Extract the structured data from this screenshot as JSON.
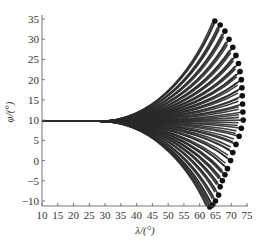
{
  "chart_data": {
    "type": "line",
    "title": "",
    "xlabel": "λ/(°)",
    "ylabel": "φ/(°)",
    "xlim": [
      10,
      75
    ],
    "ylim": [
      -11,
      35
    ],
    "xticks": [
      10,
      15,
      20,
      25,
      30,
      35,
      40,
      45,
      50,
      55,
      60,
      65,
      70,
      75
    ],
    "yticks": [
      -10,
      -5,
      0,
      5,
      10,
      15,
      20,
      25,
      30,
      35
    ],
    "grid": false,
    "legend": null,
    "start_point": {
      "lambda": 10,
      "phi": 9.7
    },
    "fan_start_lambda": 28,
    "endpoints": [
      {
        "lambda": 64.8,
        "phi": 34.5
      },
      {
        "lambda": 66.5,
        "phi": 33.5
      },
      {
        "lambda": 68.0,
        "phi": 32.0
      },
      {
        "lambda": 69.3,
        "phi": 30.0
      },
      {
        "lambda": 70.5,
        "phi": 28.0
      },
      {
        "lambda": 71.5,
        "phi": 26.0
      },
      {
        "lambda": 72.3,
        "phi": 24.0
      },
      {
        "lambda": 72.8,
        "phi": 22.0
      },
      {
        "lambda": 73.2,
        "phi": 20.0
      },
      {
        "lambda": 73.4,
        "phi": 18.0
      },
      {
        "lambda": 73.5,
        "phi": 16.0
      },
      {
        "lambda": 73.6,
        "phi": 14.0
      },
      {
        "lambda": 73.7,
        "phi": 12.0
      },
      {
        "lambda": 73.8,
        "phi": 10.0
      },
      {
        "lambda": 73.2,
        "phi": 8.0
      },
      {
        "lambda": 72.5,
        "phi": 6.0
      },
      {
        "lambda": 71.5,
        "phi": 4.0
      },
      {
        "lambda": 70.5,
        "phi": 2.0
      },
      {
        "lambda": 69.8,
        "phi": 0.0
      },
      {
        "lambda": 68.8,
        "phi": -2.0
      },
      {
        "lambda": 68.0,
        "phi": -3.5
      },
      {
        "lambda": 67.2,
        "phi": -5.0
      },
      {
        "lambda": 66.5,
        "phi": -6.5
      },
      {
        "lambda": 66.0,
        "phi": -8.5
      },
      {
        "lambda": 65.0,
        "phi": -10.0
      },
      {
        "lambda": 64.0,
        "phi": -11.0
      },
      {
        "lambda": 63.2,
        "phi": -11.5
      }
    ],
    "series_color": "#2a2a2a",
    "marker_color": "#111111"
  }
}
